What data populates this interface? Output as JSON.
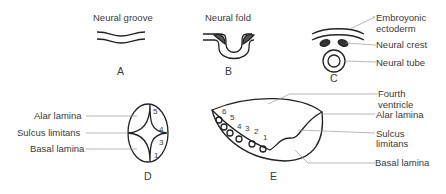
{
  "panels": {
    "A": {
      "letter": "A",
      "title": "Neural groove"
    },
    "B": {
      "letter": "B",
      "title": "Neural fold"
    },
    "C": {
      "letter": "C",
      "labels": [
        "Embroyonic",
        "ectoderm",
        "Neural crest",
        "Neural tube"
      ]
    },
    "D": {
      "letter": "D",
      "labels": [
        "Alar lamina",
        "Sulcus limitans",
        "Basal lamina"
      ],
      "numbers": [
        "5",
        "4",
        "3",
        "1"
      ]
    },
    "E": {
      "letter": "E",
      "labels": [
        "Fourth",
        "ventricle",
        "Alar lamina",
        "Sulcus",
        "limitans",
        "Basal lamina"
      ],
      "numbers": [
        "6",
        "5",
        "4",
        "3",
        "2",
        "1"
      ]
    }
  },
  "colors": {
    "line": "#222222",
    "leader": "#9a9a9a",
    "text": "#3a3a3a"
  }
}
